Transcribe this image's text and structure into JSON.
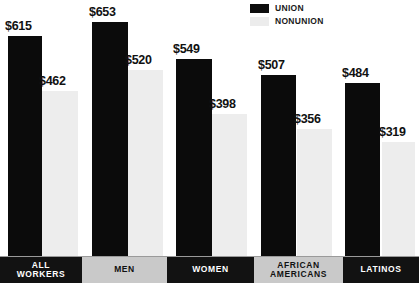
{
  "chart_data": {
    "type": "bar",
    "title": "",
    "subtitle": "",
    "xlabel": "",
    "ylabel": "",
    "ylim": [
      0,
      700
    ],
    "grid": false,
    "legend_position": "top-right",
    "value_prefix": "$",
    "categories": [
      "ALL\nWORKERS",
      "MEN",
      "WOMEN",
      "AFRICAN\nAMERICANS",
      "LATINOS"
    ],
    "series": [
      {
        "name": "UNION",
        "color": "#0b0b0b",
        "values": [
          615,
          653,
          549,
          507,
          484
        ],
        "labels": [
          "$615",
          "$653",
          "$549",
          "$507",
          "$484"
        ]
      },
      {
        "name": "NONUNION",
        "color": "#ededed",
        "values": [
          462,
          520,
          398,
          356,
          319
        ],
        "labels": [
          "$462",
          "$520",
          "$398",
          "$356",
          "$319"
        ]
      }
    ]
  },
  "legend": {
    "items": [
      {
        "label": "UNION",
        "swatch": "union"
      },
      {
        "label": "NONUNION",
        "swatch": "nonunion"
      }
    ]
  },
  "banner": {
    "cells": [
      {
        "text": "ALL\nWORKERS",
        "style": "dark"
      },
      {
        "text": "MEN",
        "style": "light"
      },
      {
        "text": "WOMEN",
        "style": "dark"
      },
      {
        "text": "AFRICAN\nAMERICANS",
        "style": "light"
      },
      {
        "text": "LATINOS",
        "style": "dark"
      }
    ]
  },
  "colors": {
    "union": "#0b0b0b",
    "nonunion": "#ededed",
    "banner_dark": "#121212",
    "banner_light": "#c9c9c9",
    "text": "#111111",
    "background": "#ffffff"
  }
}
